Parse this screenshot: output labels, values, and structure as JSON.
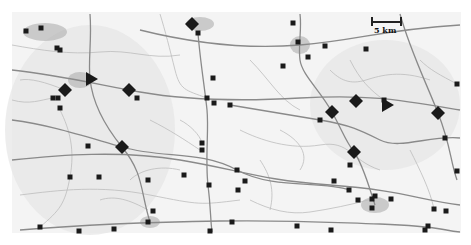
{
  "map": {
    "background": "#ffffff",
    "land_color": "#f4f4f4",
    "road_color": "#8a8a8a",
    "minor_road_color": "#bdbdbd",
    "urban_color": "#a8a8a8",
    "marker_color": "#1a1a1a",
    "bounds": {
      "x": 12,
      "y": 12,
      "w": 449,
      "h": 221
    }
  },
  "scale_bar": {
    "label": "5 km"
  },
  "shaded_regions": [
    {
      "name": "west-region",
      "cx": 90,
      "cy": 130,
      "rx": 85,
      "ry": 105
    },
    {
      "name": "east-region",
      "cx": 385,
      "cy": 105,
      "rx": 75,
      "ry": 65
    }
  ],
  "urban_areas": [
    {
      "name": "northwest-town",
      "cx": 45,
      "cy": 32,
      "rx": 22,
      "ry": 9
    },
    {
      "name": "west-town",
      "cx": 80,
      "cy": 80,
      "rx": 12,
      "ry": 8
    },
    {
      "name": "north-town",
      "cx": 200,
      "cy": 24,
      "rx": 14,
      "ry": 7
    },
    {
      "name": "northeast-town",
      "cx": 300,
      "cy": 45,
      "rx": 10,
      "ry": 9
    },
    {
      "name": "southeast-town",
      "cx": 375,
      "cy": 205,
      "rx": 14,
      "ry": 8
    },
    {
      "name": "south-town",
      "cx": 150,
      "cy": 222,
      "rx": 10,
      "ry": 6
    }
  ],
  "diamonds": [
    {
      "x": 192,
      "y": 24
    },
    {
      "x": 65,
      "y": 90
    },
    {
      "x": 129,
      "y": 90
    },
    {
      "x": 122,
      "y": 147
    },
    {
      "x": 356,
      "y": 101
    },
    {
      "x": 332,
      "y": 112
    },
    {
      "x": 438,
      "y": 113
    },
    {
      "x": 354,
      "y": 152
    }
  ],
  "triangles": [
    {
      "x": 90,
      "y": 79
    },
    {
      "x": 386,
      "y": 105
    }
  ],
  "squares": [
    [
      26,
      31
    ],
    [
      41,
      28
    ],
    [
      57,
      48
    ],
    [
      60,
      50
    ],
    [
      53,
      98
    ],
    [
      58,
      98
    ],
    [
      60,
      108
    ],
    [
      137,
      98
    ],
    [
      198,
      33
    ],
    [
      293,
      23
    ],
    [
      298,
      42
    ],
    [
      283,
      66
    ],
    [
      213,
      78
    ],
    [
      207,
      98
    ],
    [
      214,
      103
    ],
    [
      230,
      105
    ],
    [
      308,
      57
    ],
    [
      325,
      46
    ],
    [
      366,
      49
    ],
    [
      457,
      84
    ],
    [
      384,
      100
    ],
    [
      320,
      120
    ],
    [
      350,
      165
    ],
    [
      445,
      138
    ],
    [
      434,
      209
    ],
    [
      457,
      171
    ],
    [
      88,
      146
    ],
    [
      70,
      177
    ],
    [
      99,
      177
    ],
    [
      148,
      180
    ],
    [
      184,
      175
    ],
    [
      202,
      150
    ],
    [
      202,
      143
    ],
    [
      237,
      170
    ],
    [
      245,
      181
    ],
    [
      238,
      190
    ],
    [
      209,
      185
    ],
    [
      349,
      190
    ],
    [
      153,
      211
    ],
    [
      148,
      222
    ],
    [
      232,
      222
    ],
    [
      40,
      227
    ],
    [
      79,
      231
    ],
    [
      114,
      229
    ],
    [
      334,
      181
    ],
    [
      372,
      199
    ],
    [
      358,
      200
    ],
    [
      375,
      196
    ],
    [
      391,
      199
    ],
    [
      372,
      208
    ],
    [
      331,
      230
    ],
    [
      428,
      226
    ],
    [
      425,
      230
    ],
    [
      446,
      211
    ],
    [
      210,
      231
    ],
    [
      297,
      226
    ]
  ],
  "roads_major": [
    "M12,70 C60,75 100,85 140,92 S230,102 300,98 S400,100 460,110",
    "M12,160 C60,155 120,150 180,160 S260,180 330,185 S420,200 460,205",
    "M20,230 C80,225 150,222 220,221 S320,222 380,224 S440,230 460,232",
    "M198,33 C200,60 205,90 207,110 S205,160 208,185 S210,215 212,232",
    "M90,14 C92,40 88,60 90,79 S100,120 122,147 S140,190 150,222",
    "M300,14 C302,30 298,45 300,60 S320,90 332,112 S345,140 354,152 S370,190 375,205",
    "M12,120 C50,125 80,135 122,147 S200,150 237,170 S320,180 350,190",
    "M140,30 C180,40 240,50 300,45 S380,30 460,25",
    "M400,14 C410,50 425,80 438,113 S450,160 457,180",
    "M230,105 C260,110 290,115 320,120 S360,130 380,140 S430,135 460,138"
  ],
  "roads_minor": [
    "M12,45 C40,50 70,55 100,52 S150,60 180,55",
    "M20,195 C60,190 100,185 150,195 S200,205 240,200",
    "M150,120 C170,130 185,140 200,150",
    "M250,60 C270,80 280,100 300,110",
    "M240,130 C260,140 290,150 320,145 S350,160 380,170",
    "M60,110 C70,130 75,150 70,177 S60,210 40,227",
    "M130,180 C140,170 160,165 180,170",
    "M350,60 C360,80 370,90 384,100",
    "M410,150 C420,170 430,190 434,209",
    "M250,200 C270,210 290,215 310,212 S350,205 372,199",
    "M12,100 C30,105 40,100 53,98",
    "M160,14 C165,30 170,50 175,70 S185,90 207,98",
    "M330,70 C340,80 350,85 366,80 S400,70 430,80",
    "M260,160 C270,175 275,190 270,210",
    "M100,200 C115,195 130,200 148,210",
    "M420,60 C430,70 440,75 457,84",
    "M20,80 C30,78 45,82 65,90",
    "M180,120 C190,125 200,135 202,143",
    "M280,130 C300,140 310,155 300,170"
  ]
}
